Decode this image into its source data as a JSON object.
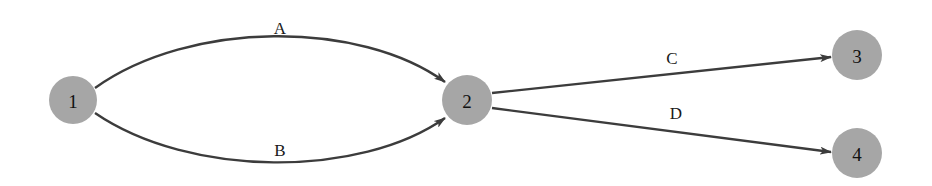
{
  "diagram": {
    "type": "directed-graph",
    "colors": {
      "node_fill": "#a6a6a6",
      "edge_stroke": "#3c3c3c",
      "label_text": "#111111",
      "background": "#ffffff"
    },
    "nodes": [
      {
        "id": "1",
        "label": "1"
      },
      {
        "id": "2",
        "label": "2"
      },
      {
        "id": "3",
        "label": "3"
      },
      {
        "id": "4",
        "label": "4"
      }
    ],
    "edges": [
      {
        "id": "A",
        "label": "A",
        "from": "1",
        "to": "2"
      },
      {
        "id": "B",
        "label": "B",
        "from": "1",
        "to": "2"
      },
      {
        "id": "C",
        "label": "C",
        "from": "2",
        "to": "3"
      },
      {
        "id": "D",
        "label": "D",
        "from": "2",
        "to": "4"
      }
    ]
  }
}
